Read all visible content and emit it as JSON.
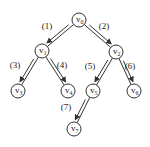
{
  "diagram": {
    "type": "tree-traversal",
    "nodes": [
      {
        "id": "v0",
        "label": "v",
        "sub": "0",
        "x": 79,
        "y": 20
      },
      {
        "id": "v1",
        "label": "v",
        "sub": "1",
        "x": 42,
        "y": 51
      },
      {
        "id": "v2",
        "label": "v",
        "sub": "2",
        "x": 116,
        "y": 52
      },
      {
        "id": "v3",
        "label": "v",
        "sub": "3",
        "x": 18,
        "y": 91
      },
      {
        "id": "v4",
        "label": "v",
        "sub": "4",
        "x": 68,
        "y": 91
      },
      {
        "id": "v5",
        "label": "v",
        "sub": "5",
        "x": 93,
        "y": 91
      },
      {
        "id": "v6",
        "label": "v",
        "sub": "6",
        "x": 134,
        "y": 91
      },
      {
        "id": "v7",
        "label": "v",
        "sub": "7",
        "x": 74,
        "y": 129
      }
    ],
    "edges": [
      {
        "from": "v0",
        "to": "v1",
        "label": "(1)",
        "lx": 47,
        "ly": 29
      },
      {
        "from": "v0",
        "to": "v2",
        "label": "(2)",
        "lx": 104,
        "ly": 29
      },
      {
        "from": "v1",
        "to": "v3",
        "label": "(3)",
        "lx": 15,
        "ly": 68
      },
      {
        "from": "v1",
        "to": "v4",
        "label": "(4)",
        "lx": 62,
        "ly": 68
      },
      {
        "from": "v2",
        "to": "v5",
        "label": "(5)",
        "lx": 90,
        "ly": 69
      },
      {
        "from": "v2",
        "to": "v6",
        "label": "(6)",
        "lx": 130,
        "ly": 69
      },
      {
        "from": "v5",
        "to": "v7",
        "label": "(7)",
        "lx": 66,
        "ly": 110
      }
    ],
    "colors": {
      "stroke": "#333333",
      "background": "#ffffff",
      "text": "#222222"
    }
  }
}
